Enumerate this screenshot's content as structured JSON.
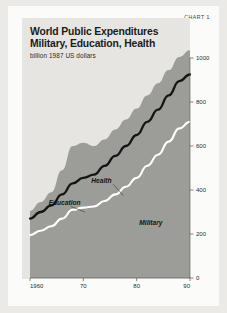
{
  "page": {
    "chart_number": "CHART 1"
  },
  "chart_data": {
    "type": "area",
    "title": "World Public Expenditures Military, Education, Health",
    "title_line1": "World Public Expenditures",
    "title_line2": "Military, Education, Health",
    "subtitle": "billion 1987 US dollars",
    "xlabel": "",
    "ylabel": "billion 1987 US dollars",
    "stacked": true,
    "grid": false,
    "legend_position": "inline-annotations",
    "xlim": [
      1960,
      1990
    ],
    "ylim": [
      0,
      1000
    ],
    "xticks": [
      1960,
      1970,
      1980,
      1990
    ],
    "xticklabels": [
      "1960",
      "70",
      "80",
      "90"
    ],
    "yticks": [
      0,
      200,
      400,
      600,
      800,
      1000
    ],
    "yticklabels": [
      "0",
      "200",
      "400",
      "600",
      "800",
      "1000"
    ],
    "x": [
      1960,
      1962,
      1964,
      1966,
      1968,
      1970,
      1972,
      1974,
      1976,
      1978,
      1980,
      1982,
      1984,
      1986,
      1988,
      1990
    ],
    "series": [
      {
        "name": "Military",
        "color": "#9c9c98",
        "boundary_line_color": "#ffffff",
        "values": [
          195,
          215,
          235,
          270,
          310,
          320,
          325,
          350,
          380,
          415,
          455,
          510,
          560,
          620,
          680,
          710
        ]
      },
      {
        "name": "Education",
        "color": "#9c9c98",
        "boundary_line_color": "#141414",
        "values": [
          75,
          85,
          95,
          110,
          120,
          135,
          145,
          160,
          175,
          185,
          195,
          200,
          205,
          210,
          215,
          215
        ]
      },
      {
        "name": "Health",
        "color": "#9c9c98",
        "boundary_line_color": "#9c9c98",
        "values": [
          35,
          45,
          60,
          110,
          170,
          160,
          130,
          120,
          120,
          120,
          120,
          120,
          120,
          115,
          110,
          110
        ]
      }
    ],
    "cumulative_military": [
      195,
      215,
      235,
      270,
      310,
      320,
      325,
      350,
      380,
      415,
      455,
      510,
      560,
      620,
      680,
      710
    ],
    "cumulative_education": [
      270,
      300,
      330,
      380,
      430,
      455,
      470,
      510,
      555,
      600,
      650,
      710,
      765,
      830,
      895,
      925
    ],
    "cumulative_total": [
      305,
      345,
      390,
      490,
      600,
      615,
      600,
      630,
      675,
      720,
      770,
      830,
      885,
      945,
      1005,
      1035
    ],
    "annotations": [
      {
        "text": "Education",
        "x": 1963.5,
        "y": 330,
        "leader_to_x": 1965.8,
        "leader_to_y": 300
      },
      {
        "text": "Health",
        "x": 1971.5,
        "y": 430,
        "leader_to_x": 1973.0,
        "leader_to_y": 375
      },
      {
        "text": "Military",
        "x": 1980.5,
        "y": 240,
        "leader_to_x": null,
        "leader_to_y": null
      }
    ],
    "colors": {
      "area_fill": "#9c9c98",
      "panel_background": "#e6e5e2",
      "card_background": "#fbfbfa",
      "page_background": "#eceae7",
      "education_line": "#141414",
      "military_line": "#ffffff",
      "text": "#1b1b1b"
    }
  }
}
